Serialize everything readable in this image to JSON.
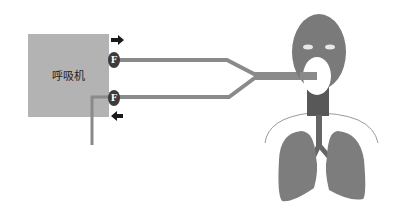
{
  "diagram": {
    "title": "",
    "ventilator": {
      "label": "呼吸机",
      "color": "#b3b3b3"
    },
    "flow_sensors": [
      {
        "label": "F",
        "position": "inspiratory"
      },
      {
        "label": "F",
        "position": "expiratory"
      }
    ],
    "arrows": [
      {
        "direction": "right",
        "meaning": "inspiratory-flow-out"
      },
      {
        "direction": "left",
        "meaning": "expiratory-flow-in"
      }
    ],
    "colors": {
      "tube": "#8a8a8a",
      "sensor": "#3c3c3c",
      "arrow": "#1a1a1a",
      "head": "#7a7a7a",
      "trachea": "#585858",
      "lungs": "#7d7d7d",
      "ribs_line": "#9a9a9a",
      "mask": "#ffffff",
      "eyes": "#e8e8e8"
    },
    "patient": {
      "parts": [
        "head",
        "eyes",
        "mask",
        "trachea",
        "bronchi",
        "left-lung",
        "right-lung",
        "chest-outline"
      ]
    }
  }
}
